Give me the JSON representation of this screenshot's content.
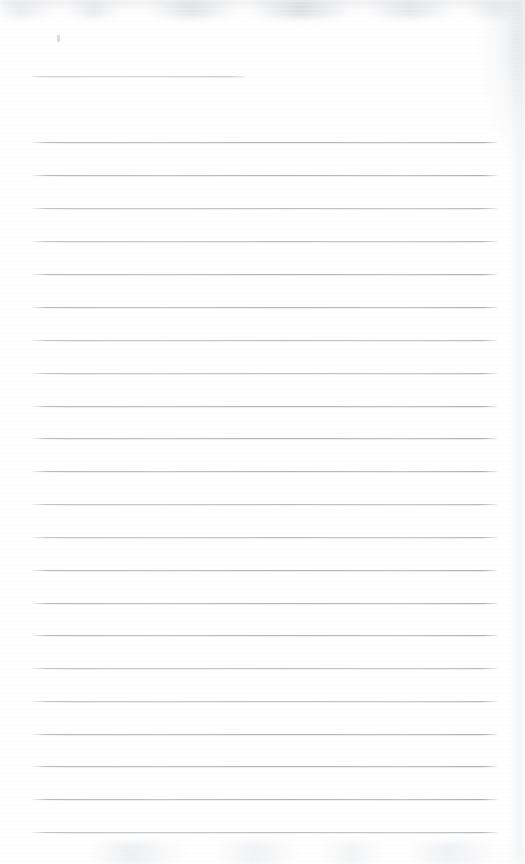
{
  "document": {
    "kind": "scanned-lined-notebook-page",
    "title": "Blank ruled notebook page",
    "body_text": "",
    "page_width": 525,
    "page_height": 864,
    "background_color": "#ffffff",
    "rule_color": "#b2b6bc",
    "smudge_color": "#ced0d4"
  },
  "ruling": {
    "left_margin_x": 33,
    "right_margin_x": 497,
    "line_spacing": 33,
    "line_count": 23,
    "lines": [
      {
        "index": 1,
        "y": 76,
        "x_start": 31,
        "x_end": 247,
        "full_width": false
      },
      {
        "index": 2,
        "y": 142,
        "x_start": 33,
        "x_end": 497,
        "full_width": true
      },
      {
        "index": 3,
        "y": 175,
        "x_start": 33,
        "x_end": 497,
        "full_width": true
      },
      {
        "index": 4,
        "y": 208,
        "x_start": 33,
        "x_end": 497,
        "full_width": true
      },
      {
        "index": 5,
        "y": 241,
        "x_start": 33,
        "x_end": 497,
        "full_width": true
      },
      {
        "index": 6,
        "y": 274,
        "x_start": 33,
        "x_end": 497,
        "full_width": true
      },
      {
        "index": 7,
        "y": 307,
        "x_start": 33,
        "x_end": 497,
        "full_width": true
      },
      {
        "index": 8,
        "y": 340,
        "x_start": 33,
        "x_end": 497,
        "full_width": true
      },
      {
        "index": 9,
        "y": 373,
        "x_start": 33,
        "x_end": 497,
        "full_width": true
      },
      {
        "index": 10,
        "y": 406,
        "x_start": 33,
        "x_end": 497,
        "full_width": true
      },
      {
        "index": 11,
        "y": 438,
        "x_start": 33,
        "x_end": 497,
        "full_width": true
      },
      {
        "index": 12,
        "y": 471,
        "x_start": 33,
        "x_end": 497,
        "full_width": true
      },
      {
        "index": 13,
        "y": 504,
        "x_start": 33,
        "x_end": 497,
        "full_width": true
      },
      {
        "index": 14,
        "y": 537,
        "x_start": 33,
        "x_end": 497,
        "full_width": true
      },
      {
        "index": 15,
        "y": 570,
        "x_start": 33,
        "x_end": 497,
        "full_width": true
      },
      {
        "index": 16,
        "y": 603,
        "x_start": 33,
        "x_end": 497,
        "full_width": true
      },
      {
        "index": 17,
        "y": 635,
        "x_start": 33,
        "x_end": 497,
        "full_width": true
      },
      {
        "index": 18,
        "y": 668,
        "x_start": 33,
        "x_end": 497,
        "full_width": true
      },
      {
        "index": 19,
        "y": 701,
        "x_start": 33,
        "x_end": 497,
        "full_width": true
      },
      {
        "index": 20,
        "y": 734,
        "x_start": 33,
        "x_end": 497,
        "full_width": true
      },
      {
        "index": 21,
        "y": 766,
        "x_start": 33,
        "x_end": 497,
        "full_width": true
      },
      {
        "index": 22,
        "y": 799,
        "x_start": 33,
        "x_end": 497,
        "full_width": true
      },
      {
        "index": 23,
        "y": 832,
        "x_start": 33,
        "x_end": 497,
        "full_width": true
      }
    ]
  },
  "marks": [
    {
      "name": "pencil-speck",
      "x": 57,
      "y": 35,
      "width": 3,
      "height": 7
    }
  ],
  "artifacts": {
    "top_smudge": "faint grey scan smudge band across the top edge",
    "bottom_smudge": "faint grey scan smudge band across the bottom edge",
    "right_shadow": "soft grey shading along the right edge, strongest near the top-right corner"
  }
}
